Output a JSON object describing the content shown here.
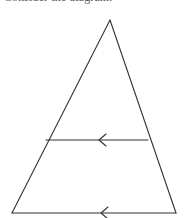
{
  "canvas": {
    "width": 185,
    "height": 218,
    "background_color": "#ffffff"
  },
  "prompt": {
    "text": "Consider the diagram.",
    "color": "#5a5a5a",
    "clipped": "top line is cut off at the image edge; only the bottom pixels of the glyphs are visible"
  },
  "figure": {
    "stroke_color": "#333333",
    "stroke_width": 1.1,
    "fill": "none",
    "vertices": {
      "apex": {
        "x": 110,
        "y": 20
      },
      "base_left": {
        "x": 12,
        "y": 213
      },
      "base_right": {
        "x": 176,
        "y": 213
      }
    },
    "midsegment": {
      "left": {
        "x": 46,
        "y": 140
      },
      "right": {
        "x": 148,
        "y": 140
      }
    },
    "arrow_marks": [
      {
        "name": "midsegment-arrow",
        "direction": "left",
        "tip_x": 99,
        "y": 140,
        "size": 7,
        "description": "single chevron tick marking the midsegment as parallel"
      },
      {
        "name": "base-arrow",
        "direction": "left",
        "tip_x": 101,
        "y": 213,
        "size": 7,
        "description": "single chevron tick marking the base as parallel"
      }
    ]
  }
}
